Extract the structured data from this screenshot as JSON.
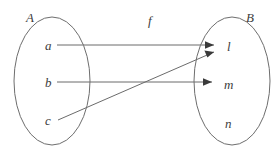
{
  "diagram": {
    "type": "function-mapping-venn",
    "function_label": "f",
    "function_label_pos": {
      "x": 148,
      "y": 14
    },
    "domain_set": {
      "name": "A",
      "label_pos": {
        "x": 26,
        "y": 11
      },
      "ellipse": {
        "cx": 52,
        "cy": 81,
        "rx": 38,
        "ry": 64
      },
      "elements": [
        {
          "id": "a",
          "label": "a",
          "x": 45,
          "y": 39
        },
        {
          "id": "b",
          "label": "b",
          "x": 45,
          "y": 76
        },
        {
          "id": "c",
          "label": "c",
          "x": 45,
          "y": 114
        }
      ]
    },
    "codomain_set": {
      "name": "B",
      "label_pos": {
        "x": 246,
        "y": 11
      },
      "ellipse": {
        "cx": 232,
        "cy": 81,
        "rx": 38,
        "ry": 64
      },
      "elements": [
        {
          "id": "l",
          "label": "l",
          "x": 227,
          "y": 40
        },
        {
          "id": "m",
          "label": "m",
          "x": 224,
          "y": 78
        },
        {
          "id": "n",
          "label": "n",
          "x": 225,
          "y": 117
        }
      ]
    },
    "mappings": [
      {
        "from": "a",
        "to": "l",
        "x1": 57,
        "y1": 45,
        "x2": 214,
        "y2": 45
      },
      {
        "from": "b",
        "to": "m",
        "x1": 57,
        "y1": 82,
        "x2": 212,
        "y2": 82
      },
      {
        "from": "c",
        "to": "l",
        "x1": 58,
        "y1": 120,
        "x2": 214,
        "y2": 52
      }
    ],
    "colors": {
      "outline": "#6e6e6e",
      "line": "#6b6b6b",
      "arrow": "#3a3a3a",
      "text": "#3d3d3d",
      "background": "#ffffff"
    }
  }
}
